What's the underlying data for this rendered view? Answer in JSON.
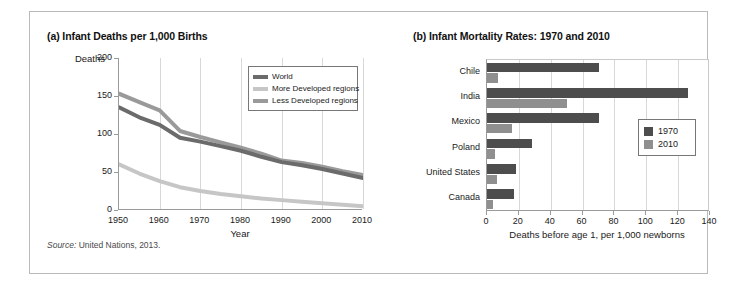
{
  "figure": {
    "source_prefix": "Source:",
    "source_text": " United Nations, 2013."
  },
  "panel_a": {
    "title": "(a) Infant Deaths per 1,000 Births"
  },
  "panel_b": {
    "title": "(b) Infant Mortality Rates: 1970 and 2010"
  },
  "colors": {
    "world": "#6b6b6b",
    "more_developed": "#c6c6c6",
    "less_developed": "#9a9a9a",
    "year_1970": "#4d4d4d",
    "year_2010": "#8f8f8f",
    "grid": "#d8d8d8",
    "axis": "#9a9a9a"
  },
  "chart_data": [
    {
      "type": "line",
      "title": "(a) Infant Deaths per 1,000 Births",
      "xlabel": "Year",
      "ylabel": "Deaths",
      "xlim": [
        1950,
        2010
      ],
      "ylim": [
        0,
        200
      ],
      "xticks": [
        1950,
        1960,
        1970,
        1980,
        1990,
        2000,
        2010
      ],
      "yticks": [
        0,
        50,
        100,
        150,
        200
      ],
      "grid": "vertical",
      "legend_position": "top-right",
      "x": [
        1950,
        1955,
        1960,
        1965,
        1970,
        1975,
        1980,
        1985,
        1990,
        1995,
        2000,
        2005,
        2010
      ],
      "series": [
        {
          "name": "World",
          "values": [
            135,
            122,
            112,
            95,
            90,
            84,
            78,
            70,
            63,
            59,
            54,
            48,
            42
          ]
        },
        {
          "name": "More Developed regions",
          "values": [
            60,
            48,
            38,
            30,
            25,
            21,
            18,
            15,
            13,
            11,
            9,
            7,
            5
          ]
        },
        {
          "name": "Less Developed regions",
          "values": [
            153,
            142,
            131,
            104,
            96,
            89,
            82,
            74,
            65,
            62,
            57,
            51,
            46
          ]
        }
      ]
    },
    {
      "type": "bar",
      "orientation": "horizontal",
      "title": "(b) Infant Mortality Rates: 1970 and 2010",
      "xlabel": "Deaths before age 1, per 1,000 newborns",
      "ylabel": "",
      "xlim": [
        0,
        140
      ],
      "xticks": [
        0,
        20,
        40,
        60,
        80,
        100,
        120,
        140
      ],
      "grid": "vertical",
      "legend_position": "right-middle",
      "categories": [
        "Chile",
        "India",
        "Mexico",
        "Poland",
        "United States",
        "Canada"
      ],
      "series": [
        {
          "name": "1970",
          "values": [
            70,
            126,
            70,
            28,
            18,
            17
          ]
        },
        {
          "name": "2010",
          "values": [
            7,
            50,
            16,
            5,
            6,
            4
          ]
        }
      ]
    }
  ]
}
